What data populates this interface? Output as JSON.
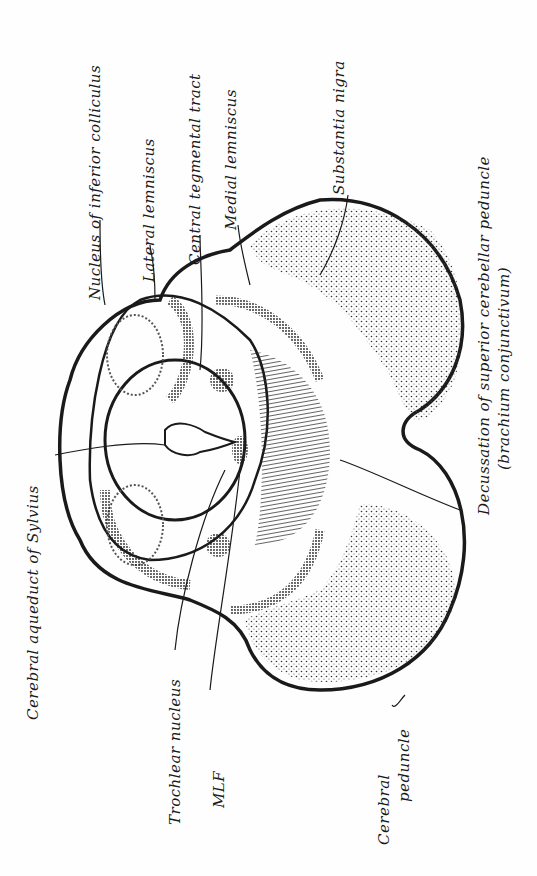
{
  "labels": {
    "nucleus_inferior_colliculus": "Nucleus of inferior colliculus",
    "lateral_lemniscus": "Lateral lemniscus",
    "central_tegmental_tract": "Central tegmental tract",
    "medial_lemniscus": "Medial lemniscus",
    "substantia_nigra": "Substantia nigra",
    "decussation_line1": "Decussation of superior cerebellar peduncle",
    "decussation_line2": "(brachium conjunctivum)",
    "cerebral_aqueduct": "Cerebral aqueduct of Sylvius",
    "trochlear_nucleus": "Trochlear nucleus",
    "mlf": "MLF",
    "cerebral_peduncle_line1": "Cerebral",
    "cerebral_peduncle_line2": "peduncle"
  },
  "colors": {
    "ink": "#1a1a1a",
    "stipple": "#3a3a3a",
    "background": "#fefefe"
  }
}
